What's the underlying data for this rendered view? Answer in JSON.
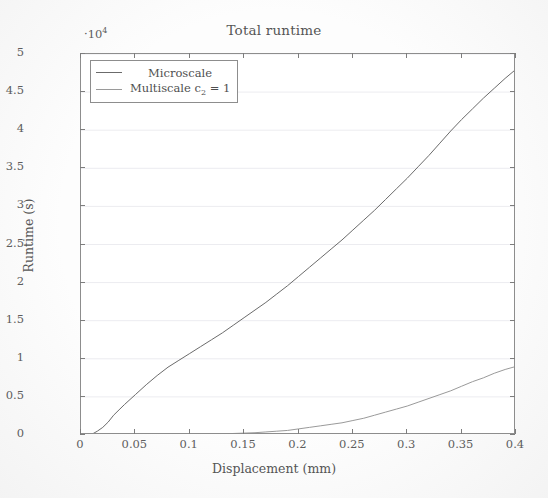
{
  "chart_data": {
    "type": "line",
    "title": "Total runtime",
    "xlabel": "Displacement (mm)",
    "ylabel": "Runtime (s)",
    "y_multiplier": "·10",
    "y_multiplier_exp": "4",
    "xlim": [
      0,
      0.4
    ],
    "ylim": [
      0,
      5
    ],
    "xticks": [
      "0",
      "0.05",
      "0.1",
      "0.15",
      "0.2",
      "0.25",
      "0.3",
      "0.35",
      "0.4"
    ],
    "xtick_values": [
      0,
      0.05,
      0.1,
      0.15,
      0.2,
      0.25,
      0.3,
      0.35,
      0.4
    ],
    "yticks": [
      "0",
      "0.5",
      "1",
      "1.5",
      "2",
      "2.5",
      "3",
      "3.5",
      "4",
      "4.5",
      "5"
    ],
    "ytick_values": [
      0,
      0.5,
      1,
      1.5,
      2,
      2.5,
      3,
      3.5,
      4,
      4.5,
      5
    ],
    "grid": true,
    "grid_axis": "y",
    "legend_position": "upper left",
    "series": [
      {
        "name": "Microscale",
        "color": "#6b6b6b",
        "x": [
          0,
          0.005,
          0.01,
          0.015,
          0.02,
          0.025,
          0.03,
          0.035,
          0.04,
          0.05,
          0.06,
          0.07,
          0.08,
          0.09,
          0.1,
          0.11,
          0.12,
          0.13,
          0.14,
          0.15,
          0.16,
          0.17,
          0.18,
          0.19,
          0.2,
          0.21,
          0.22,
          0.23,
          0.24,
          0.25,
          0.26,
          0.27,
          0.28,
          0.29,
          0.3,
          0.31,
          0.32,
          0.33,
          0.34,
          0.35,
          0.36,
          0.37,
          0.38,
          0.39,
          0.4
        ],
        "y": [
          0,
          0.0,
          0.01,
          0.05,
          0.1,
          0.17,
          0.26,
          0.33,
          0.4,
          0.53,
          0.66,
          0.78,
          0.89,
          0.98,
          1.07,
          1.16,
          1.25,
          1.34,
          1.44,
          1.54,
          1.64,
          1.74,
          1.85,
          1.96,
          2.08,
          2.2,
          2.32,
          2.44,
          2.56,
          2.69,
          2.82,
          2.95,
          3.09,
          3.23,
          3.37,
          3.52,
          3.67,
          3.83,
          3.99,
          4.14,
          4.28,
          4.42,
          4.55,
          4.68,
          4.8
        ]
      },
      {
        "name": "Multiscale c₂ = 1",
        "label_main": "Multiscale c",
        "label_sub": "2",
        "label_tail": " = 1",
        "color": "#9a9a9a",
        "x": [
          0,
          0.02,
          0.04,
          0.06,
          0.08,
          0.1,
          0.12,
          0.14,
          0.16,
          0.17,
          0.18,
          0.19,
          0.2,
          0.21,
          0.22,
          0.23,
          0.24,
          0.25,
          0.26,
          0.27,
          0.28,
          0.29,
          0.3,
          0.31,
          0.32,
          0.33,
          0.34,
          0.35,
          0.36,
          0.37,
          0.38,
          0.39,
          0.4
        ],
        "y": [
          0,
          0.0,
          0.0,
          0.0,
          0.0,
          0.01,
          0.01,
          0.02,
          0.03,
          0.04,
          0.05,
          0.06,
          0.08,
          0.1,
          0.12,
          0.14,
          0.16,
          0.19,
          0.22,
          0.26,
          0.3,
          0.34,
          0.38,
          0.43,
          0.48,
          0.53,
          0.58,
          0.64,
          0.7,
          0.75,
          0.81,
          0.86,
          0.9
        ]
      }
    ]
  },
  "legend": {
    "items": [
      {
        "label": "Microscale"
      },
      {
        "label_main": "Multiscale c",
        "label_sub": "2",
        "label_tail": " = 1"
      }
    ]
  }
}
